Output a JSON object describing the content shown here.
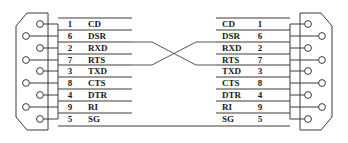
{
  "diagram": {
    "colors": {
      "line": "#3a3a3a",
      "cross_line": "#55555a",
      "text": "#1a1a1a",
      "background": "#ffffff"
    }
  },
  "left_connector": {
    "name": "DB9 connector left",
    "pin_count": 9,
    "rows": [
      {
        "pin": "1",
        "signal": "CD"
      },
      {
        "pin": "6",
        "signal": "DSR"
      },
      {
        "pin": "2",
        "signal": "RXD"
      },
      {
        "pin": "7",
        "signal": "RTS"
      },
      {
        "pin": "3",
        "signal": "TXD"
      },
      {
        "pin": "8",
        "signal": "CTS"
      },
      {
        "pin": "4",
        "signal": "DTR"
      },
      {
        "pin": "9",
        "signal": "RI"
      },
      {
        "pin": "5",
        "signal": "SG"
      }
    ]
  },
  "right_connector": {
    "name": "DB9 connector right",
    "pin_count": 9,
    "rows": [
      {
        "signal": "CD",
        "pin": "1"
      },
      {
        "signal": "DSR",
        "pin": "6"
      },
      {
        "signal": "RXD",
        "pin": "2"
      },
      {
        "signal": "RTS",
        "pin": "7"
      },
      {
        "signal": "TXD",
        "pin": "3"
      },
      {
        "signal": "CTS",
        "pin": "8"
      },
      {
        "signal": "DTR",
        "pin": "4"
      },
      {
        "signal": "RI",
        "pin": "9"
      },
      {
        "signal": "SG",
        "pin": "5"
      }
    ]
  },
  "crossover": {
    "description": "RXD and TXD lines cross between the two connectors",
    "left_rows": [
      "RXD",
      "TXD"
    ],
    "right_rows": [
      "RXD",
      "TXD"
    ]
  }
}
